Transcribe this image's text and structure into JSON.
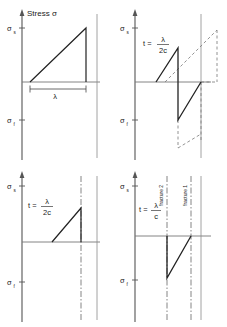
{
  "figure": {
    "title": "Stress σ",
    "axis": {
      "y_upper_label": "σs",
      "y_lower_label": "σf",
      "y_upper_sigma": "σ",
      "y_upper_sub": "s",
      "y_lower_sigma": "σ",
      "y_lower_sub": "f"
    },
    "colors": {
      "ink": "#1a1a1a",
      "axis": "#555555",
      "wave": "#222222",
      "dashed": "#666666",
      "background": "#ffffff"
    }
  },
  "panels": [
    {
      "id": "panel-1",
      "position": "top-left",
      "title": "Stress σ",
      "time_label": "",
      "wavelength_label": "λ",
      "has_wavelength_bracket": true,
      "waveform": "ramp-up-then-vertical-drop",
      "y_upper_label": "σs",
      "y_lower_label": "σf",
      "fracture_lines": []
    },
    {
      "id": "panel-2",
      "position": "top-right",
      "title": "",
      "time_label": "t =",
      "time_numer": "λ",
      "time_denom": "2c",
      "wavelength_label": "",
      "has_wavelength_bracket": false,
      "waveform": "sawtooth-up-drop-up",
      "y_upper_label": "σs",
      "y_lower_label": "σf",
      "fracture_lines": []
    },
    {
      "id": "panel-3",
      "position": "bottom-left",
      "title": "",
      "time_label": "t =",
      "time_numer": "λ",
      "time_denom": "2c",
      "wavelength_label": "",
      "has_wavelength_bracket": false,
      "waveform": "ramp-up-truncated",
      "y_upper_label": "σs",
      "y_lower_label": "σf",
      "fracture_lines": [
        "",
        ""
      ]
    },
    {
      "id": "panel-4",
      "position": "bottom-right",
      "title": "",
      "time_label": "t =",
      "time_numer": "λ",
      "time_denom": "c",
      "wavelength_label": "",
      "has_wavelength_bracket": false,
      "waveform": "drop-then-ramp-below-axis",
      "y_upper_label": "σs",
      "y_lower_label": "σf",
      "fracture_lines": [
        "fracture 2",
        "fracture 1"
      ]
    }
  ],
  "annotations": {
    "fracture_2": "fracture 2",
    "fracture_1": "fracture 1",
    "sigma": "σ",
    "lambda": "λ"
  }
}
